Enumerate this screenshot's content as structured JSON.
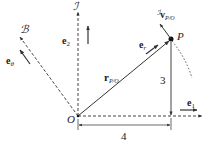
{
  "diagram": {
    "type": "vector-kinematics",
    "frames": {
      "inertial_label": "ℐ",
      "body_label": "ℬ"
    },
    "points": {
      "origin": {
        "label": "O",
        "x": 78,
        "y": 116
      },
      "point": {
        "label": "P",
        "x": 171,
        "y": 39
      }
    },
    "vectors": {
      "e1": {
        "main": "e",
        "sub": "1"
      },
      "e2": {
        "main": "e",
        "sub": "2"
      },
      "etheta": {
        "main": "e",
        "sub": "θ"
      },
      "er": {
        "main": "e",
        "sub": "r"
      },
      "r_PO": {
        "main": "r",
        "sub": "P/O"
      },
      "v_PO": {
        "pre": "ℐ",
        "main": "v",
        "sub": "P/O"
      }
    },
    "dimensions": {
      "horizontal": "4",
      "vertical": "3"
    },
    "colors": {
      "stroke": "#333333",
      "text": "#222222",
      "background": "#ffffff"
    }
  }
}
